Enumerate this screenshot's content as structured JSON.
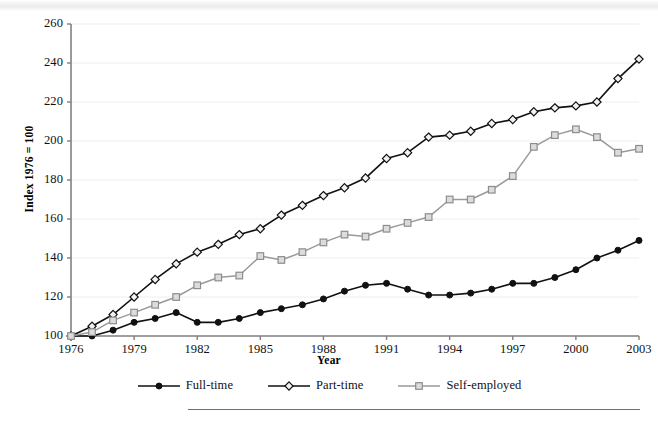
{
  "chart_data": {
    "type": "line",
    "title": "",
    "xlabel": "Year",
    "ylabel": "Index 1976 = 100",
    "xlim": [
      1976,
      2003
    ],
    "ylim": [
      100,
      260
    ],
    "yticks": [
      100,
      120,
      140,
      160,
      180,
      200,
      220,
      240,
      260
    ],
    "xticks": [
      1976,
      1979,
      1982,
      1985,
      1988,
      1991,
      1994,
      1997,
      2000,
      2003
    ],
    "grid": "horizontal",
    "legend_position": "bottom",
    "x": [
      1976,
      1977,
      1978,
      1979,
      1980,
      1981,
      1982,
      1983,
      1984,
      1985,
      1986,
      1987,
      1988,
      1989,
      1990,
      1991,
      1992,
      1993,
      1994,
      1995,
      1996,
      1997,
      1998,
      1999,
      2000,
      2001,
      2002,
      2003
    ],
    "series": [
      {
        "name": "Full-time",
        "marker": "filled-circle",
        "color": "#111111",
        "values": [
          100,
          100,
          103,
          107,
          109,
          112,
          107,
          107,
          109,
          112,
          114,
          116,
          119,
          123,
          126,
          127,
          124,
          121,
          121,
          122,
          124,
          127,
          127,
          130,
          134,
          140,
          144,
          149
        ]
      },
      {
        "name": "Part-time",
        "marker": "open-diamond",
        "color": "#111111",
        "values": [
          100,
          105,
          111,
          120,
          129,
          137,
          143,
          147,
          152,
          155,
          162,
          167,
          172,
          176,
          181,
          191,
          194,
          202,
          203,
          205,
          209,
          211,
          215,
          217,
          218,
          220,
          232,
          242
        ]
      },
      {
        "name": "Self-employed",
        "marker": "open-square",
        "color": "#9a9a9a",
        "values": [
          100,
          102,
          108,
          112,
          116,
          120,
          126,
          130,
          131,
          141,
          139,
          143,
          148,
          152,
          151,
          155,
          158,
          161,
          170,
          170,
          175,
          182,
          197,
          203,
          206,
          202,
          194,
          196
        ]
      }
    ]
  },
  "legend": {
    "items": [
      {
        "label": "Full-time"
      },
      {
        "label": "Part-time"
      },
      {
        "label": "Self-employed"
      }
    ]
  }
}
